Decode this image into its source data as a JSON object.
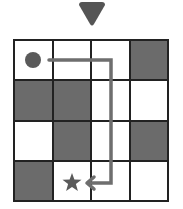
{
  "direction_indicator": {
    "icon": "triangle-down-icon",
    "color": "#555555"
  },
  "grid": {
    "rows": 4,
    "cols": 4,
    "cells": [
      [
        "light",
        "light",
        "light",
        "dark"
      ],
      [
        "dark",
        "dark",
        "light",
        "light"
      ],
      [
        "light",
        "dark",
        "light",
        "dark"
      ],
      [
        "dark",
        "light",
        "light",
        "light"
      ]
    ],
    "colors": {
      "dark": "#6b6b6b",
      "light": "#ffffff",
      "border": "#222222"
    }
  },
  "start": {
    "row": 0,
    "col": 0,
    "icon": "circle-icon",
    "color": "#5a5a5a"
  },
  "goal": {
    "row": 3,
    "col": 1,
    "icon": "star-icon",
    "color": "#5a5a5a"
  },
  "path": {
    "color": "#6e6e6e",
    "moves": [
      "right",
      "right",
      "down",
      "down",
      "down",
      "left"
    ]
  }
}
